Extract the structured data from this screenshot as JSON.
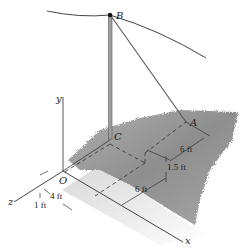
{
  "figure": {
    "type": "3D statics diagram",
    "points": {
      "B": "B",
      "A": "A",
      "C": "C",
      "O": "O"
    },
    "axes": {
      "x": "x",
      "y": "y",
      "z": "z"
    },
    "dimensions": {
      "d_6ft_upper": "6 ft",
      "d_1_5ft": "1.5 ft",
      "d_6ft_lower": "6 ft",
      "d_4ft": "4 ft",
      "d_1ft": "1 ft"
    },
    "colors": {
      "line": "#333333",
      "pole": "#888888",
      "grass": "#9a9a9a",
      "ground_shadow": "#d8d8d8"
    }
  }
}
